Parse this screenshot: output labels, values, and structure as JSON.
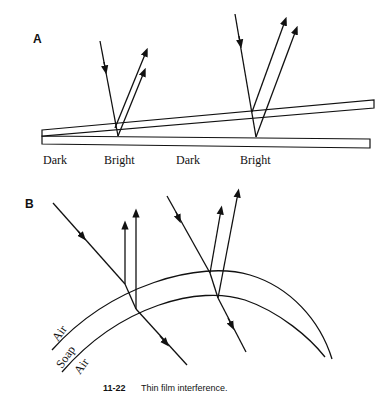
{
  "figure": {
    "caption": {
      "number": "11-22",
      "text": "Thin film interference."
    },
    "panel_a": {
      "label": "A",
      "fringe_labels": [
        "Dark",
        "Bright",
        "Dark",
        "Bright"
      ],
      "description": "Wedge-shaped air film between two glass plates; incident ray reflects from top and bottom surfaces"
    },
    "panel_b": {
      "label": "B",
      "layer_labels": [
        "Air",
        "Soap",
        "Air"
      ],
      "description": "Curved soap film; incident rays partially reflect from both surfaces and transmit through"
    },
    "colors": {
      "line": "#111111",
      "background": "#ffffff"
    }
  }
}
